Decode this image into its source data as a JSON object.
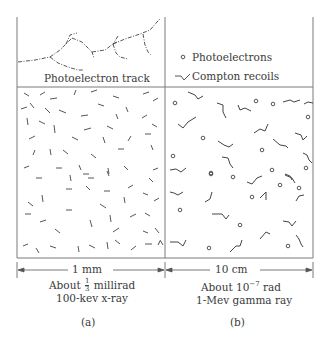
{
  "panels": {
    "a": {
      "track_label": "Photoelectron track",
      "scale_label": "1 mm",
      "dose_prefix": "About",
      "dose_frac_num": "1",
      "dose_frac_den": "3",
      "dose_suffix": "millirad",
      "radiation": "100-kev  x-ray",
      "caption": "(a)"
    },
    "b": {
      "legend": {
        "photoelectrons": "Photoelectrons",
        "compton": "Compton recoils"
      },
      "scale_label": "10 cm",
      "dose_prefix": "About 10",
      "dose_exp": "−7",
      "dose_suffix": " rad",
      "radiation": "1-Mev  gamma ray",
      "caption": "(b)"
    }
  },
  "colors": {
    "ink": "#3a3a3a",
    "frame": "#777777"
  }
}
